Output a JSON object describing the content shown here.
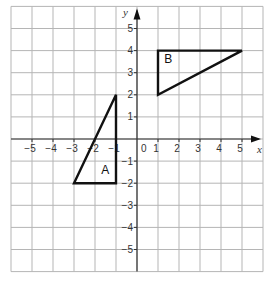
{
  "grid": {
    "x_min": -6,
    "x_max": 6,
    "y_min": -6,
    "y_max": 6,
    "origin_px": [
      137,
      139
    ],
    "unit_x_px": 21,
    "unit_y_px": 22.1,
    "grid_color": "#b5b5b5"
  },
  "axes": {
    "x_label": "x",
    "y_label": "y",
    "x_ticks": [
      {
        "v": -5,
        "label": "−5"
      },
      {
        "v": -4,
        "label": "−4"
      },
      {
        "v": -3,
        "label": "−3"
      },
      {
        "v": -2,
        "label": "−2"
      },
      {
        "v": -1,
        "label": "−1"
      },
      {
        "v": 0,
        "label": "0"
      },
      {
        "v": 1,
        "label": "1"
      },
      {
        "v": 2,
        "label": "2"
      },
      {
        "v": 3,
        "label": "3"
      },
      {
        "v": 4,
        "label": "4"
      },
      {
        "v": 5,
        "label": "5"
      }
    ],
    "y_ticks": [
      {
        "v": 5,
        "label": "5"
      },
      {
        "v": 4,
        "label": "4"
      },
      {
        "v": 3,
        "label": "3"
      },
      {
        "v": 2,
        "label": "2"
      },
      {
        "v": 1,
        "label": "1"
      },
      {
        "v": -1,
        "label": "−1"
      },
      {
        "v": -2,
        "label": "−2"
      },
      {
        "v": -3,
        "label": "−3"
      },
      {
        "v": -4,
        "label": "−4"
      },
      {
        "v": -5,
        "label": "−5"
      }
    ]
  },
  "shapes": [
    {
      "name": "A",
      "label": "A",
      "vertices": [
        [
          -1,
          2
        ],
        [
          -1,
          -2
        ],
        [
          -3,
          -2
        ]
      ],
      "label_pos": [
        -1.7,
        -1.6
      ]
    },
    {
      "name": "B",
      "label": "B",
      "vertices": [
        [
          1,
          4
        ],
        [
          5,
          4
        ],
        [
          1,
          2
        ]
      ],
      "label_pos": [
        1.3,
        3.45
      ]
    }
  ]
}
